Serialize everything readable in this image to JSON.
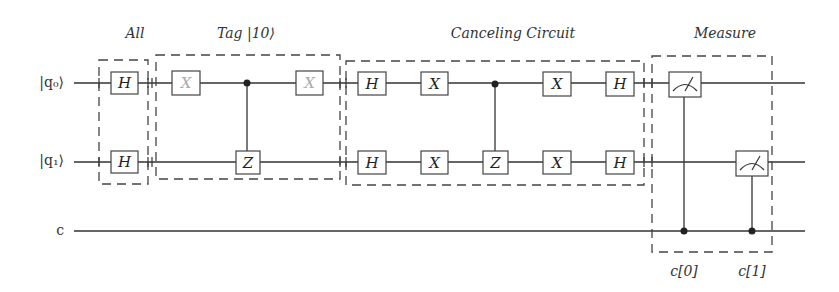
{
  "diagram": {
    "type": "quantum-circuit",
    "wires": [
      {
        "id": "q0",
        "label": "|q₀⟩"
      },
      {
        "id": "q1",
        "label": "|q₁⟩"
      },
      {
        "id": "c",
        "label": "c"
      }
    ],
    "sections": [
      {
        "id": "all",
        "title": "All"
      },
      {
        "id": "tag",
        "title": "Tag |10⟩"
      },
      {
        "id": "canceling",
        "title": "Canceling Circuit"
      },
      {
        "id": "measure",
        "title": "Measure"
      }
    ],
    "gates": {
      "all_h_q0": "H",
      "all_h_q1": "H",
      "tag_x1_q0": "X",
      "tag_cz_target_q1": "Z",
      "tag_x2_q0": "X",
      "cancel_h1_q0": "H",
      "cancel_h1_q1": "H",
      "cancel_x1_q0": "X",
      "cancel_x1_q1": "X",
      "cancel_cz_target_q1": "Z",
      "cancel_x2_q0": "X",
      "cancel_x2_q1": "X",
      "cancel_h2_q0": "H",
      "cancel_h2_q1": "H"
    },
    "measure_outputs": [
      "c[0]",
      "c[1]"
    ],
    "colors": {
      "wire": "#333333",
      "faded_gate_label": "#aaaaaa",
      "gate_label": "#222222"
    }
  }
}
